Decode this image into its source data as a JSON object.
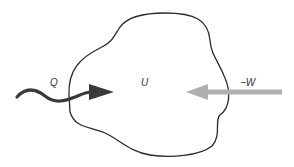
{
  "diagram": {
    "type": "thermodynamic-system",
    "labels": {
      "heat": "Q",
      "internal_energy": "U",
      "work": "−W"
    },
    "colors": {
      "boundary": "#2a2a2a",
      "heat_arrow": "#3a3a3a",
      "work_arrow": "#b0b0b0",
      "background": "#ffffff"
    }
  }
}
